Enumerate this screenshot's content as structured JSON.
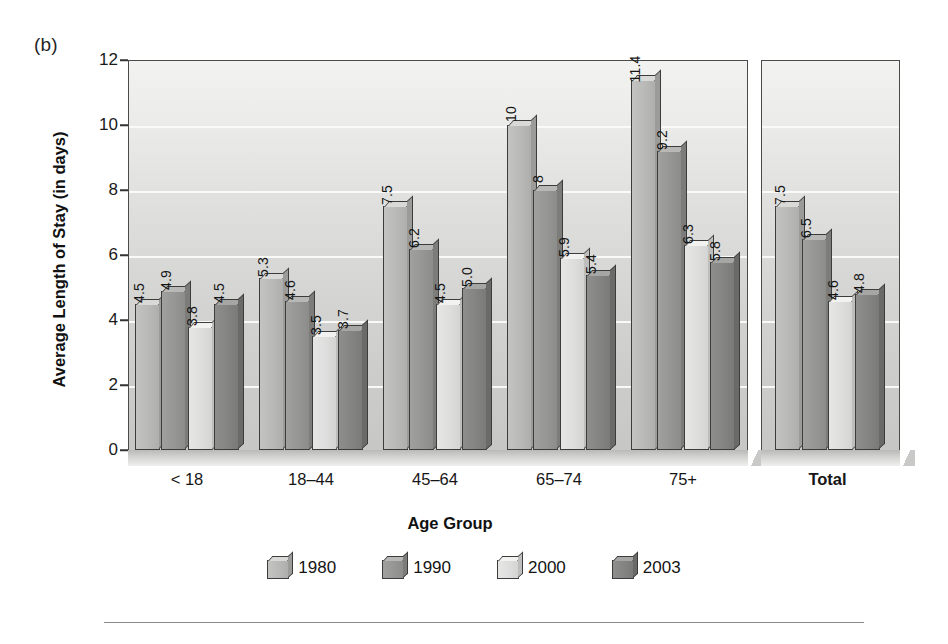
{
  "figure": {
    "panel_label": "(b)",
    "bottom_rule": true
  },
  "chart_data": {
    "type": "bar",
    "title": "",
    "xlabel": "Age Group",
    "ylabel": "Average Length of Stay (in days)",
    "ylim": [
      0,
      12
    ],
    "yticks": [
      0,
      2,
      4,
      6,
      8,
      10,
      12
    ],
    "ytick_labels": [
      "0",
      "2",
      "4",
      "6",
      "8",
      "10",
      "12"
    ],
    "grid": true,
    "legend_position": "bottom",
    "categories": [
      "< 18",
      "18–44",
      "45–64",
      "65–74",
      "75+",
      "Total"
    ],
    "series": [
      {
        "name": "1980",
        "color": "#b9b9b7",
        "values": [
          4.5,
          5.3,
          7.5,
          10,
          11.4,
          7.5
        ],
        "labels": [
          "4.5",
          "5.3",
          "7.5",
          "10",
          "11.4",
          "7.5"
        ]
      },
      {
        "name": "1990",
        "color": "#969694",
        "values": [
          4.9,
          4.6,
          6.2,
          8,
          9.2,
          6.5
        ],
        "labels": [
          "4.9",
          "4.6",
          "6.2",
          "8",
          "9.2",
          "6.5"
        ]
      },
      {
        "name": "2000",
        "color": "#dedede",
        "values": [
          3.8,
          3.5,
          4.5,
          5.9,
          6.3,
          4.6
        ],
        "labels": [
          "3.8",
          "3.5",
          "4.5",
          "5.9",
          "6.3",
          "4.6"
        ]
      },
      {
        "name": "2003",
        "color": "#848482",
        "values": [
          4.5,
          3.7,
          5.0,
          5.4,
          5.8,
          4.8
        ],
        "labels": [
          "4.5",
          "3.7",
          "5.0",
          "5.4",
          "5.8",
          "4.8"
        ]
      }
    ]
  }
}
